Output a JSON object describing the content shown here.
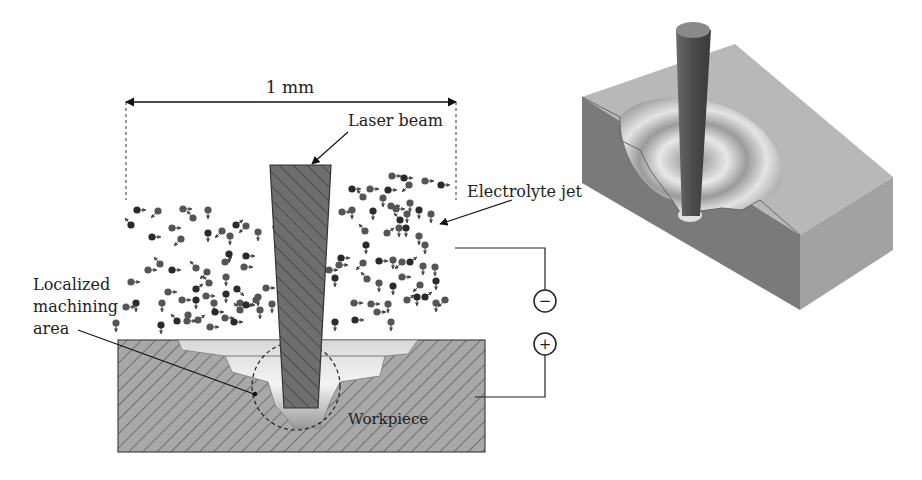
{
  "labels": {
    "dimension": "1 mm",
    "laser_beam": "Laser beam",
    "electrolyte_jet": "Electrolyte jet",
    "localized_line1": "Localized",
    "localized_line2": "machining",
    "localized_line3": "area",
    "workpiece": "Workpiece",
    "minus": "−",
    "plus": "+"
  },
  "colors": {
    "hatch_fill": "#a8a8a8",
    "beam_fill": "#6e6e6e",
    "particle_dark": "#2a2a2a",
    "particle_mid": "#555555",
    "block_top": "#b9b9b9",
    "block_front": "#7a7a7a",
    "block_side": "#9a9a9a"
  },
  "particles": [
    [
      137,
      210,
      "r"
    ],
    [
      183,
      209,
      "r"
    ],
    [
      208,
      210,
      "d"
    ],
    [
      131,
      225,
      "ul"
    ],
    [
      158,
      211,
      "dl"
    ],
    [
      172,
      228,
      "r"
    ],
    [
      152,
      237,
      "r"
    ],
    [
      181,
      239,
      "dl"
    ],
    [
      193,
      218,
      "ul"
    ],
    [
      208,
      233,
      "d"
    ],
    [
      222,
      231,
      "dl"
    ],
    [
      230,
      236,
      "d"
    ],
    [
      236,
      225,
      "ur"
    ],
    [
      246,
      226,
      "dl"
    ],
    [
      258,
      232,
      "d"
    ],
    [
      276,
      227,
      "d"
    ],
    [
      160,
      264,
      "ul"
    ],
    [
      148,
      270,
      "r"
    ],
    [
      172,
      270,
      "r"
    ],
    [
      196,
      268,
      "ul"
    ],
    [
      207,
      272,
      "dl"
    ],
    [
      229,
      254,
      "d"
    ],
    [
      225,
      262,
      "ur"
    ],
    [
      244,
      267,
      "r"
    ],
    [
      246,
      256,
      "r"
    ],
    [
      131,
      282,
      "r"
    ],
    [
      168,
      292,
      "r"
    ],
    [
      196,
      289,
      "ur"
    ],
    [
      209,
      283,
      "ul"
    ],
    [
      226,
      277,
      "d"
    ],
    [
      237,
      289,
      "dr"
    ],
    [
      258,
      297,
      "d"
    ],
    [
      266,
      288,
      "r"
    ],
    [
      136,
      303,
      "d"
    ],
    [
      162,
      303,
      "d"
    ],
    [
      182,
      300,
      "r"
    ],
    [
      196,
      300,
      "d"
    ],
    [
      206,
      296,
      "r"
    ],
    [
      214,
      303,
      "d"
    ],
    [
      226,
      294,
      "d"
    ],
    [
      240,
      303,
      "r"
    ],
    [
      256,
      300,
      "dl"
    ],
    [
      177,
      321,
      "ul"
    ],
    [
      188,
      315,
      "d"
    ],
    [
      198,
      320,
      "ur"
    ],
    [
      215,
      312,
      "r"
    ],
    [
      225,
      318,
      "r"
    ],
    [
      240,
      310,
      "ul"
    ],
    [
      246,
      305,
      "r"
    ],
    [
      260,
      310,
      "d"
    ],
    [
      272,
      304,
      "d"
    ],
    [
      161,
      325,
      "d"
    ],
    [
      187,
      321,
      "r"
    ],
    [
      210,
      327,
      "r"
    ],
    [
      234,
      322,
      "r"
    ],
    [
      116,
      323,
      "d"
    ],
    [
      126,
      307,
      "r"
    ],
    [
      352,
      189,
      "r"
    ],
    [
      370,
      189,
      "r"
    ],
    [
      392,
      176,
      "r"
    ],
    [
      404,
      178,
      "r"
    ],
    [
      363,
      197,
      "ul"
    ],
    [
      383,
      198,
      "d"
    ],
    [
      388,
      190,
      "r"
    ],
    [
      409,
      185,
      "dl"
    ],
    [
      425,
      181,
      "r"
    ],
    [
      441,
      185,
      "r"
    ],
    [
      342,
      212,
      "r"
    ],
    [
      352,
      210,
      "d"
    ],
    [
      373,
      211,
      "d"
    ],
    [
      391,
      206,
      "r"
    ],
    [
      396,
      209,
      "r"
    ],
    [
      400,
      220,
      "ul"
    ],
    [
      407,
      214,
      "d"
    ],
    [
      410,
      203,
      "d"
    ],
    [
      419,
      210,
      "d"
    ],
    [
      431,
      214,
      "d"
    ],
    [
      365,
      231,
      "ul"
    ],
    [
      366,
      245,
      "d"
    ],
    [
      387,
      233,
      "ur"
    ],
    [
      399,
      228,
      "d"
    ],
    [
      406,
      228,
      "d"
    ],
    [
      419,
      236,
      "d"
    ],
    [
      425,
      245,
      "d"
    ],
    [
      341,
      258,
      "r"
    ],
    [
      339,
      265,
      "r"
    ],
    [
      363,
      263,
      "dl"
    ],
    [
      379,
      261,
      "r"
    ],
    [
      393,
      260,
      "d"
    ],
    [
      402,
      262,
      "dl"
    ],
    [
      410,
      262,
      "ur"
    ],
    [
      423,
      266,
      "d"
    ],
    [
      435,
      267,
      "d"
    ],
    [
      335,
      278,
      "d"
    ],
    [
      367,
      279,
      "ul"
    ],
    [
      379,
      283,
      "d"
    ],
    [
      393,
      286,
      "d"
    ],
    [
      402,
      277,
      "r"
    ],
    [
      420,
      285,
      "dl"
    ],
    [
      436,
      281,
      "d"
    ],
    [
      388,
      304,
      "d"
    ],
    [
      407,
      300,
      "ur"
    ],
    [
      417,
      297,
      "d"
    ],
    [
      436,
      303,
      "d"
    ],
    [
      445,
      300,
      "dl"
    ],
    [
      313,
      285,
      "d"
    ],
    [
      354,
      303,
      "r"
    ],
    [
      371,
      304,
      "r"
    ],
    [
      355,
      320,
      "r"
    ],
    [
      377,
      312,
      "r"
    ],
    [
      391,
      322,
      "d"
    ],
    [
      335,
      322,
      "d"
    ],
    [
      308,
      310,
      "d"
    ],
    [
      329,
      270,
      "r"
    ],
    [
      425,
      297,
      "ur"
    ]
  ]
}
